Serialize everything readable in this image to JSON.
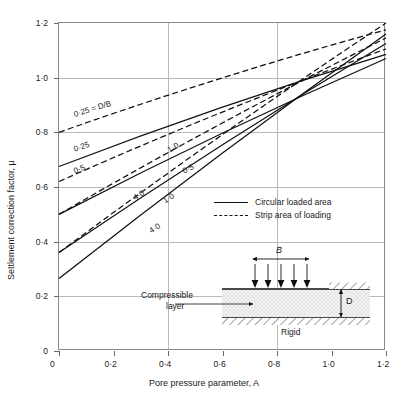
{
  "chart_data": {
    "type": "line",
    "title": "",
    "xlabel": "Pore pressure parameter, A",
    "ylabel": "Settlement correction factor, μ",
    "xlim": [
      0,
      1.2
    ],
    "ylim": [
      0,
      1.2
    ],
    "xticks": [
      0,
      0.2,
      0.4,
      0.6,
      0.8,
      1.0,
      1.2
    ],
    "yticks": [
      0,
      0.2,
      0.4,
      0.6,
      0.8,
      1.0,
      1.2
    ],
    "xtick_labels": [
      "0",
      "0·2",
      "0·4",
      "0·6",
      "0·8",
      "1·0",
      "1·2"
    ],
    "ytick_labels": [
      "0",
      "0·2",
      "0·4",
      "0·6",
      "0·8",
      "1·0",
      "1·2"
    ],
    "grid": true,
    "legend_position": "center-right",
    "series": [
      {
        "name": "0·25 = D/B",
        "style": "dashed",
        "group": "strip",
        "x": [
          0,
          1.2
        ],
        "y": [
          0.8,
          1.175
        ]
      },
      {
        "name": "0·5",
        "style": "dashed",
        "group": "strip",
        "x": [
          0,
          1.2
        ],
        "y": [
          0.62,
          1.105
        ]
      },
      {
        "name": "1·0",
        "style": "dashed",
        "group": "strip",
        "x": [
          0,
          1.2
        ],
        "y": [
          0.5,
          1.145
        ]
      },
      {
        "name": "4·0",
        "style": "dashed",
        "group": "strip",
        "x": [
          0,
          1.2
        ],
        "y": [
          0.36,
          1.2
        ]
      },
      {
        "name": "0·25",
        "style": "solid",
        "group": "circular",
        "x": [
          0,
          1.2
        ],
        "y": [
          0.675,
          1.085
        ]
      },
      {
        "name": "0·5",
        "style": "solid",
        "group": "circular",
        "x": [
          0,
          1.2
        ],
        "y": [
          0.5,
          1.07
        ]
      },
      {
        "name": "1·0",
        "style": "solid",
        "group": "circular",
        "x": [
          0,
          1.2
        ],
        "y": [
          0.36,
          1.125
        ]
      },
      {
        "name": "4·0",
        "style": "solid",
        "group": "circular",
        "x": [
          0,
          1.2
        ],
        "y": [
          0.265,
          1.16
        ]
      }
    ],
    "annotations": [
      {
        "text": "0·25 = D/B",
        "x": 0.055,
        "y": 0.865,
        "rotate": -17
      },
      {
        "text": "0·25",
        "x": 0.055,
        "y": 0.735,
        "rotate": -19
      },
      {
        "text": "0·5",
        "x": 0.055,
        "y": 0.655,
        "rotate": -23
      },
      {
        "text": "1·0",
        "x": 0.4,
        "y": 0.73,
        "rotate": -30
      },
      {
        "text": "0·5",
        "x": 0.455,
        "y": 0.655,
        "rotate": -27
      },
      {
        "text": "4·0",
        "x": 0.275,
        "y": 0.555,
        "rotate": -33
      },
      {
        "text": "1·0",
        "x": 0.385,
        "y": 0.545,
        "rotate": -33
      },
      {
        "text": "4·0",
        "x": 0.335,
        "y": 0.435,
        "rotate": -33
      }
    ]
  },
  "legend": {
    "items": [
      {
        "label": "Circular loaded area",
        "style": "solid"
      },
      {
        "label": "Strip area of loading",
        "style": "dashed"
      }
    ]
  },
  "inset": {
    "width_label": "B",
    "depth_label": "D",
    "layer_label_line1": "Compressible",
    "layer_label_line2": "layer",
    "base_label": "Rigid",
    "load_arrow_count": 5
  },
  "colors": {
    "line": "#111111",
    "frame": "#8a8a8a",
    "grid": "#b9b9b9",
    "text": "#1a1a1a",
    "background": "#ffffff",
    "soil_fill": "#efefef"
  }
}
